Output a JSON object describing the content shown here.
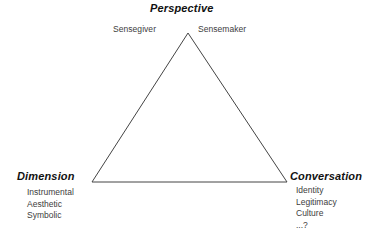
{
  "diagram": {
    "top": {
      "title": "Perspective",
      "left_label": "Sensegiver",
      "right_label": "Sensemaker"
    },
    "bottom_left": {
      "title": "Dimension",
      "items": [
        "Instrumental",
        "Aesthetic",
        "Symbolic"
      ]
    },
    "bottom_right": {
      "title": "Conversation",
      "items": [
        "Identity",
        "Legitimacy",
        "Culture",
        "...?"
      ]
    },
    "shape": {
      "name": "triangle",
      "apex": {
        "x": 188,
        "y": 33
      },
      "bottom_left": {
        "x": 92,
        "y": 182
      },
      "bottom_right": {
        "x": 287,
        "y": 182
      },
      "stroke_color": "#444444",
      "stroke_width": 1,
      "fill": "none"
    },
    "background_color": "#ffffff",
    "text_color": "#3d3d3d",
    "title_color": "#111111"
  }
}
